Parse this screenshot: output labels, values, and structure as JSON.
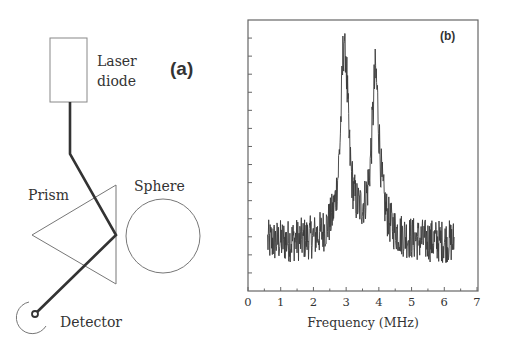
{
  "diagram": {
    "panel_label": "(a)",
    "components": {
      "laser": "Laser",
      "laser_line2": "diode",
      "prism": "Prism",
      "sphere": "Sphere",
      "detector": "Detector"
    }
  },
  "chart_data": {
    "type": "line",
    "panel_label": "(b)",
    "title": "",
    "xlabel": "Frequency (MHz)",
    "ylabel": "",
    "xlim": [
      0,
      7
    ],
    "x_ticks": [
      "0",
      "1",
      "2",
      "3",
      "4",
      "5",
      "6",
      "7"
    ],
    "y_ticks_labeled": false,
    "y_tick_count": 14,
    "grid": false,
    "legend": "none",
    "series": [
      {
        "name": "spectrum",
        "x_range": [
          0.6,
          6.3
        ],
        "baseline_relative": 0.18,
        "noise_relative": 0.08,
        "peaks": [
          {
            "center_mhz": 2.95,
            "height_relative": 0.9,
            "width_mhz": 0.13
          },
          {
            "center_mhz": 3.9,
            "height_relative": 0.75,
            "width_mhz": 0.14
          }
        ]
      }
    ]
  }
}
